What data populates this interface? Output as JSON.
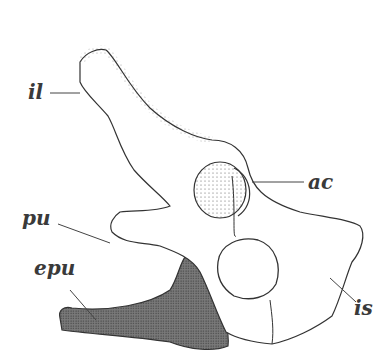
{
  "figure": {
    "colors": {
      "bone_outline": "#333333",
      "stipple": "#555555",
      "epipubis_fill": "#666666",
      "background": "#ffffff"
    },
    "labels": [
      {
        "id": "il",
        "text": "il",
        "x": 30,
        "y": 82
      },
      {
        "id": "ac",
        "text": "ac",
        "x": 310,
        "y": 172
      },
      {
        "id": "pu",
        "text": "pu",
        "x": 22,
        "y": 208
      },
      {
        "id": "epu",
        "text": "epu",
        "x": 34,
        "y": 258
      },
      {
        "id": "is",
        "text": "is",
        "x": 346,
        "y": 298
      }
    ]
  }
}
